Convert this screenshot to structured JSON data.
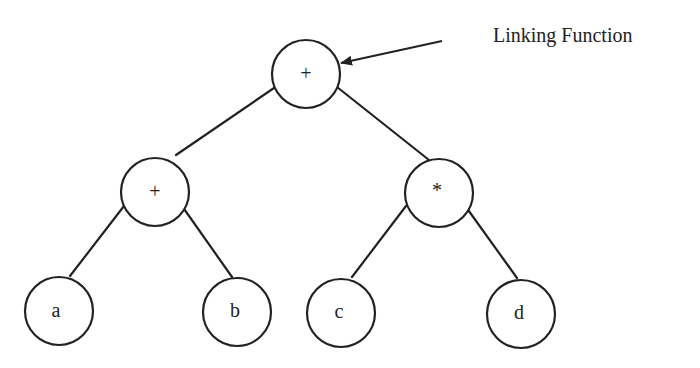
{
  "diagram": {
    "type": "expression-tree",
    "annotation": {
      "label": "Linking Function",
      "points_to": "root"
    },
    "nodes": [
      {
        "id": "root",
        "label": "+",
        "cx": 306,
        "cy": 74
      },
      {
        "id": "left-op",
        "label": "+",
        "cx": 155,
        "cy": 192
      },
      {
        "id": "right-op",
        "label": "*",
        "cx": 439,
        "cy": 193
      },
      {
        "id": "leaf-a",
        "label": "a",
        "cx": 59,
        "cy": 311
      },
      {
        "id": "leaf-b",
        "label": "b",
        "cx": 237,
        "cy": 312
      },
      {
        "id": "leaf-c",
        "label": "c",
        "cx": 341,
        "cy": 313
      },
      {
        "id": "leaf-d",
        "label": "d",
        "cx": 521,
        "cy": 314
      }
    ],
    "edges": [
      {
        "from": "root",
        "to": "left-op"
      },
      {
        "from": "root",
        "to": "right-op"
      },
      {
        "from": "left-op",
        "to": "leaf-a"
      },
      {
        "from": "left-op",
        "to": "leaf-b"
      },
      {
        "from": "right-op",
        "to": "leaf-c"
      },
      {
        "from": "right-op",
        "to": "leaf-d"
      }
    ],
    "colors": {
      "stroke": "#222222",
      "background": "#ffffff"
    }
  }
}
